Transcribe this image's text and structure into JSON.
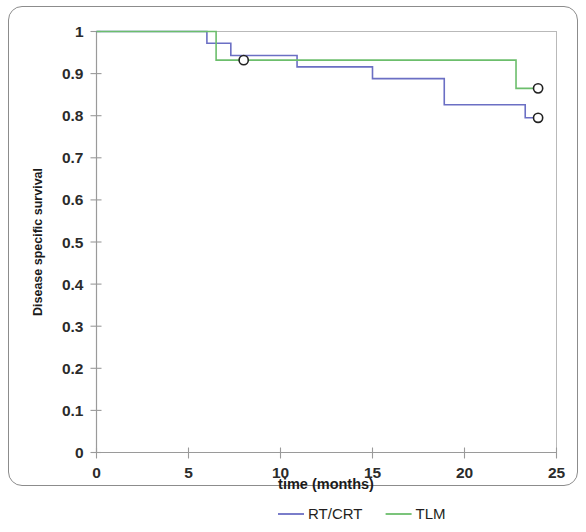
{
  "chart_data": {
    "type": "line",
    "subtype": "kaplan-meier-step",
    "title": "",
    "xlabel": "time (months)",
    "ylabel": "Disease specific survival",
    "xlim": [
      0,
      25
    ],
    "ylim": [
      0,
      1
    ],
    "xticks": [
      0,
      5,
      10,
      15,
      20,
      25
    ],
    "xtick_labels": [
      "0",
      "5",
      "10",
      "15",
      "20",
      "25"
    ],
    "yticks": [
      0,
      0.1,
      0.2,
      0.3,
      0.4,
      0.5,
      0.6,
      0.7,
      0.8,
      0.9,
      1
    ],
    "ytick_labels": [
      "0",
      "0.1",
      "0.2",
      "0.3",
      "0.4",
      "0.5",
      "0.6",
      "0.7",
      "0.8",
      "0.9",
      "1"
    ],
    "grid": false,
    "legend_position": "bottom",
    "series": [
      {
        "name": "RT/CRT",
        "color": "#6b6fc4",
        "steps": [
          {
            "x": 0,
            "y": 1.0
          },
          {
            "x": 6.0,
            "y": 1.0
          },
          {
            "x": 6.0,
            "y": 0.972
          },
          {
            "x": 7.3,
            "y": 0.972
          },
          {
            "x": 7.3,
            "y": 0.943
          },
          {
            "x": 10.9,
            "y": 0.943
          },
          {
            "x": 10.9,
            "y": 0.916
          },
          {
            "x": 15.0,
            "y": 0.916
          },
          {
            "x": 15.0,
            "y": 0.888
          },
          {
            "x": 18.9,
            "y": 0.888
          },
          {
            "x": 18.9,
            "y": 0.826
          },
          {
            "x": 23.3,
            "y": 0.826
          },
          {
            "x": 23.3,
            "y": 0.795
          },
          {
            "x": 24.0,
            "y": 0.795
          }
        ],
        "censored": [
          {
            "x": 24.0,
            "y": 0.795
          }
        ]
      },
      {
        "name": "TLM",
        "color": "#6cbe6c",
        "steps": [
          {
            "x": 0,
            "y": 1.0
          },
          {
            "x": 6.5,
            "y": 1.0
          },
          {
            "x": 6.5,
            "y": 0.932
          },
          {
            "x": 22.8,
            "y": 0.932
          },
          {
            "x": 22.8,
            "y": 0.865
          },
          {
            "x": 24.0,
            "y": 0.865
          }
        ],
        "censored": [
          {
            "x": 8.0,
            "y": 0.932
          },
          {
            "x": 24.0,
            "y": 0.865
          }
        ]
      }
    ],
    "legend": [
      {
        "label": "RT/CRT",
        "color": "#6b6fc4"
      },
      {
        "label": "TLM",
        "color": "#6cbe6c"
      }
    ]
  },
  "colors": {
    "rt_crt": "#6b6fc4",
    "tlm": "#6cbe6c",
    "axis": "#9a9a9a",
    "frame": "#b9b9b9",
    "text": "#231f20"
  }
}
